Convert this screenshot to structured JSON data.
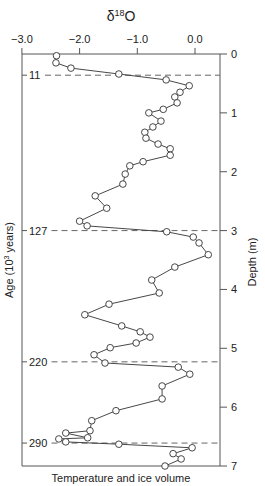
{
  "chart_data": {
    "type": "line",
    "title": "δ18O",
    "title_main": "δ",
    "title_sup": "18",
    "title_tail": "O",
    "xlabel": "Temperature and ice volume",
    "ylabel_left": "Age (10³ years)",
    "ylabel_left_main": "Age (10",
    "ylabel_left_sup": "3",
    "ylabel_left_tail": " years)",
    "ylabel_right": "Depth (m)",
    "x_axis_position": "top",
    "xlim": [
      -3.0,
      0.4
    ],
    "ylim": [
      0,
      7
    ],
    "y_inverted": true,
    "x_ticks": [
      -3.0,
      -2.0,
      -1.0,
      0.0
    ],
    "x_tick_labels": [
      "−3.0",
      "−2.0",
      "−1.0",
      "0.0"
    ],
    "y_ticks": [
      0,
      1,
      2,
      3,
      4,
      5,
      6,
      7
    ],
    "y_tick_labels": [
      "0",
      "1",
      "2",
      "3",
      "4",
      "5",
      "6",
      "7"
    ],
    "age_markers": [
      {
        "label": "11",
        "depth": 0.36
      },
      {
        "label": "127",
        "depth": 3.0
      },
      {
        "label": "220",
        "depth": 5.23
      },
      {
        "label": "290",
        "depth": 6.61
      }
    ],
    "grid": false,
    "legend": null,
    "marker": "open-circle",
    "series": [
      {
        "name": "δ18O",
        "points": [
          {
            "d18O": -2.4,
            "depth": 0.03
          },
          {
            "d18O": -2.41,
            "depth": 0.15
          },
          {
            "d18O": -2.15,
            "depth": 0.24
          },
          {
            "d18O": -1.32,
            "depth": 0.34
          },
          {
            "d18O": -0.5,
            "depth": 0.44
          },
          {
            "d18O": -0.1,
            "depth": 0.54
          },
          {
            "d18O": -0.26,
            "depth": 0.65
          },
          {
            "d18O": -0.35,
            "depth": 0.73
          },
          {
            "d18O": -0.31,
            "depth": 0.83
          },
          {
            "d18O": -0.55,
            "depth": 0.94
          },
          {
            "d18O": -0.8,
            "depth": 1.0
          },
          {
            "d18O": -0.59,
            "depth": 1.14
          },
          {
            "d18O": -0.73,
            "depth": 1.24
          },
          {
            "d18O": -0.87,
            "depth": 1.33
          },
          {
            "d18O": -0.85,
            "depth": 1.43
          },
          {
            "d18O": -0.64,
            "depth": 1.53
          },
          {
            "d18O": -0.43,
            "depth": 1.61
          },
          {
            "d18O": -0.43,
            "depth": 1.72
          },
          {
            "d18O": -0.9,
            "depth": 1.83
          },
          {
            "d18O": -1.13,
            "depth": 1.9
          },
          {
            "d18O": -1.21,
            "depth": 2.04
          },
          {
            "d18O": -1.25,
            "depth": 2.21
          },
          {
            "d18O": -1.73,
            "depth": 2.41
          },
          {
            "d18O": -1.53,
            "depth": 2.62
          },
          {
            "d18O": -2.0,
            "depth": 2.84
          },
          {
            "d18O": -1.87,
            "depth": 2.92
          },
          {
            "d18O": -0.49,
            "depth": 3.02
          },
          {
            "d18O": -0.03,
            "depth": 3.11
          },
          {
            "d18O": 0.07,
            "depth": 3.21
          },
          {
            "d18O": 0.23,
            "depth": 3.41
          },
          {
            "d18O": -0.35,
            "depth": 3.62
          },
          {
            "d18O": -0.75,
            "depth": 3.84
          },
          {
            "d18O": -0.62,
            "depth": 4.06
          },
          {
            "d18O": -1.49,
            "depth": 4.25
          },
          {
            "d18O": -1.91,
            "depth": 4.43
          },
          {
            "d18O": -1.27,
            "depth": 4.62
          },
          {
            "d18O": -0.95,
            "depth": 4.72
          },
          {
            "d18O": -0.78,
            "depth": 4.81
          },
          {
            "d18O": -1.02,
            "depth": 4.91
          },
          {
            "d18O": -1.47,
            "depth": 4.99
          },
          {
            "d18O": -1.75,
            "depth": 5.11
          },
          {
            "d18O": -1.56,
            "depth": 5.25
          },
          {
            "d18O": -0.29,
            "depth": 5.32
          },
          {
            "d18O": -0.09,
            "depth": 5.44
          },
          {
            "d18O": -0.57,
            "depth": 5.64
          },
          {
            "d18O": -0.57,
            "depth": 5.86
          },
          {
            "d18O": -1.37,
            "depth": 6.06
          },
          {
            "d18O": -1.79,
            "depth": 6.23
          },
          {
            "d18O": -1.82,
            "depth": 6.4
          },
          {
            "d18O": -2.24,
            "depth": 6.44
          },
          {
            "d18O": -1.86,
            "depth": 6.52
          },
          {
            "d18O": -2.36,
            "depth": 6.54
          },
          {
            "d18O": -2.24,
            "depth": 6.59
          },
          {
            "d18O": -1.32,
            "depth": 6.63
          },
          {
            "d18O": -0.05,
            "depth": 6.69
          },
          {
            "d18O": -0.38,
            "depth": 6.79
          },
          {
            "d18O": -0.24,
            "depth": 6.88
          },
          {
            "d18O": -0.52,
            "depth": 7.0
          }
        ]
      }
    ]
  }
}
